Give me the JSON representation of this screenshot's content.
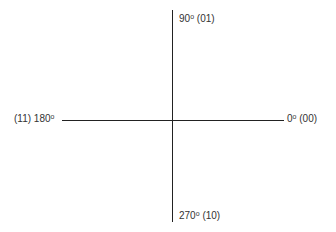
{
  "diagram": {
    "type": "quadrant-axes",
    "labels": {
      "top": {
        "angle": "90",
        "degree_symbol": "o",
        "code": "(01)"
      },
      "right": {
        "angle": "0",
        "degree_symbol": "o",
        "code": "(00)"
      },
      "bottom": {
        "angle": "270",
        "degree_symbol": "o",
        "code": "(10)"
      },
      "left": {
        "angle": "180",
        "degree_symbol": "o",
        "code": "(11)"
      }
    },
    "colors": {
      "line": "#222222",
      "text": "#333333",
      "background": "#ffffff"
    }
  }
}
